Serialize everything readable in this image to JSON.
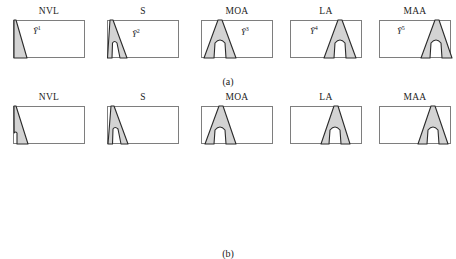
{
  "figure": {
    "rows": [
      {
        "id": "row-a",
        "caption": "(a)",
        "panels": [
          {
            "title": "NVL",
            "label": "Ỹ",
            "superscript": "1",
            "label_x": 20,
            "label_y": 4,
            "shape": "thin-slanted-sliver",
            "shape_x": 0
          },
          {
            "title": "S",
            "label": "Ỹ",
            "superscript": "2",
            "label_x": 25,
            "label_y": 7,
            "shape": "narrow-arch",
            "shape_x": 2
          },
          {
            "title": "MOA",
            "label": "Ỹ",
            "superscript": "3",
            "label_x": 40,
            "label_y": 5,
            "shape": "wide-arch",
            "shape_x": 3
          },
          {
            "title": "LA",
            "label": "Ỹ",
            "superscript": "4",
            "label_x": 20,
            "label_y": 4,
            "shape": "wide-arch",
            "shape_x": 34
          },
          {
            "title": "MAA",
            "label": "Ỹ",
            "superscript": "5",
            "label_x": 18,
            "label_y": 4,
            "shape": "wide-arch",
            "shape_x": 42
          }
        ]
      },
      {
        "id": "row-b",
        "caption": "(b)",
        "panels": [
          {
            "title": "NVL",
            "label": "",
            "superscript": "",
            "label_x": 0,
            "label_y": 0,
            "shape": "thin-slanted-sliver",
            "shape_x": 0
          },
          {
            "title": "S",
            "label": "",
            "superscript": "",
            "label_x": 0,
            "label_y": 0,
            "shape": "narrow-arch",
            "shape_x": 2
          },
          {
            "title": "MOA",
            "label": "",
            "superscript": "",
            "label_x": 0,
            "label_y": 0,
            "shape": "wide-arch",
            "shape_x": 3
          },
          {
            "title": "LA",
            "label": "",
            "superscript": "",
            "label_x": 0,
            "label_y": 0,
            "shape": "wide-arch",
            "shape_x": 28
          },
          {
            "title": "MAA",
            "label": "",
            "superscript": "",
            "label_x": 0,
            "label_y": 0,
            "shape": "wide-arch",
            "shape_x": 38
          }
        ]
      }
    ],
    "colors": {
      "shape_fill": "#d3d3d3",
      "shape_stroke": "#2b2b2b",
      "frame_stroke": "#7e7e7e",
      "background": "#ffffff",
      "text": "#1a1a1a"
    }
  }
}
